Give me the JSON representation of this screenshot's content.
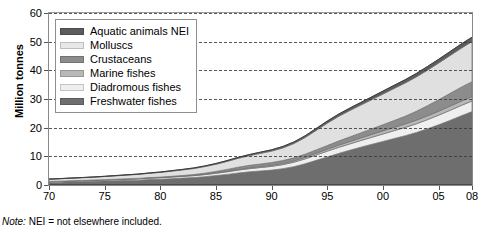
{
  "chart_data": {
    "type": "area",
    "stacked": true,
    "title": "",
    "xlabel": "",
    "ylabel": "Million tonnes",
    "ylim": [
      0,
      60
    ],
    "xlim": [
      1970,
      2008
    ],
    "grid": true,
    "gridstyle": "dashed-horizontal",
    "legend_position": "top-left",
    "ytick_labels": [
      "0",
      "10",
      "20",
      "30",
      "40",
      "50",
      "60"
    ],
    "ytick_values": [
      0,
      10,
      20,
      30,
      40,
      50,
      60
    ],
    "xtick_labels": [
      "70",
      "75",
      "80",
      "85",
      "90",
      "95",
      "00",
      "05",
      "08"
    ],
    "xtick_values": [
      1970,
      1975,
      1980,
      1985,
      1990,
      1995,
      2000,
      2005,
      2008
    ],
    "x": [
      1970,
      1971,
      1972,
      1973,
      1974,
      1975,
      1976,
      1977,
      1978,
      1979,
      1980,
      1981,
      1982,
      1983,
      1984,
      1985,
      1986,
      1987,
      1988,
      1989,
      1990,
      1991,
      1992,
      1993,
      1994,
      1995,
      1996,
      1997,
      1998,
      1999,
      2000,
      2001,
      2002,
      2003,
      2004,
      2005,
      2006,
      2007,
      2008
    ],
    "series": [
      {
        "name": "Freshwater fishes",
        "color": "#6e6e6e",
        "values": [
          0.9,
          1.0,
          1.1,
          1.2,
          1.3,
          1.4,
          1.5,
          1.6,
          1.7,
          1.9,
          2.0,
          2.2,
          2.4,
          2.6,
          2.9,
          3.3,
          3.7,
          4.2,
          4.6,
          4.9,
          5.2,
          5.7,
          6.4,
          7.4,
          8.6,
          9.8,
          11.0,
          12.1,
          13.2,
          14.2,
          15.2,
          16.2,
          17.2,
          18.3,
          19.6,
          21.0,
          22.5,
          24.1,
          25.6
        ]
      },
      {
        "name": "Diadromous fishes",
        "color": "#efefef",
        "values": [
          0.25,
          0.27,
          0.29,
          0.31,
          0.33,
          0.35,
          0.38,
          0.41,
          0.44,
          0.48,
          0.52,
          0.56,
          0.6,
          0.65,
          0.72,
          0.8,
          0.9,
          1.0,
          1.1,
          1.2,
          1.3,
          1.4,
          1.55,
          1.7,
          1.85,
          2.0,
          2.1,
          2.2,
          2.3,
          2.45,
          2.6,
          2.75,
          2.9,
          3.05,
          3.2,
          3.35,
          3.5,
          3.6,
          3.7
        ]
      },
      {
        "name": "Marine fishes",
        "color": "#b8b8b8",
        "values": [
          0.05,
          0.05,
          0.06,
          0.06,
          0.07,
          0.07,
          0.08,
          0.09,
          0.1,
          0.11,
          0.12,
          0.13,
          0.14,
          0.16,
          0.18,
          0.2,
          0.23,
          0.26,
          0.3,
          0.34,
          0.38,
          0.42,
          0.47,
          0.53,
          0.6,
          0.68,
          0.76,
          0.84,
          0.92,
          1.0,
          1.08,
          1.14,
          1.2,
          1.26,
          1.32,
          1.38,
          1.44,
          1.5,
          1.56
        ]
      },
      {
        "name": "Crustaceans",
        "color": "#8c8c8c",
        "values": [
          0.02,
          0.02,
          0.03,
          0.03,
          0.04,
          0.04,
          0.05,
          0.06,
          0.07,
          0.09,
          0.11,
          0.14,
          0.18,
          0.24,
          0.33,
          0.45,
          0.6,
          0.75,
          0.85,
          0.9,
          0.95,
          1.0,
          1.05,
          1.1,
          1.2,
          1.3,
          1.45,
          1.6,
          1.75,
          1.95,
          2.15,
          2.4,
          2.7,
          3.1,
          3.55,
          4.0,
          4.45,
          4.85,
          5.2
        ]
      },
      {
        "name": "Molluscs",
        "color": "#e0e0e0",
        "values": [
          0.8,
          0.85,
          0.9,
          0.95,
          1.0,
          1.1,
          1.2,
          1.3,
          1.4,
          1.5,
          1.65,
          1.8,
          1.95,
          2.1,
          2.3,
          2.5,
          2.8,
          3.1,
          3.4,
          3.7,
          4.0,
          4.4,
          5.0,
          5.8,
          6.8,
          7.8,
          8.6,
          9.2,
          9.7,
          10.2,
          10.7,
          11.2,
          11.6,
          12.0,
          12.4,
          12.8,
          13.2,
          13.6,
          14.0
        ]
      },
      {
        "name": "Aquatic animals NEI",
        "color": "#5c5c5c",
        "values": [
          0.05,
          0.05,
          0.06,
          0.06,
          0.07,
          0.08,
          0.09,
          0.1,
          0.11,
          0.12,
          0.14,
          0.16,
          0.18,
          0.2,
          0.23,
          0.26,
          0.3,
          0.34,
          0.38,
          0.42,
          0.46,
          0.5,
          0.55,
          0.6,
          0.66,
          0.72,
          0.78,
          0.84,
          0.9,
          0.96,
          1.02,
          1.08,
          1.14,
          1.2,
          1.26,
          1.32,
          1.38,
          1.44,
          1.5
        ]
      }
    ],
    "totals_endpoints": {
      "1970": 2.1,
      "2008": 52.5
    },
    "legend_order_top_to_bottom": [
      "Aquatic animals NEI",
      "Molluscs",
      "Crustaceans",
      "Marine fishes",
      "Diadromous fishes",
      "Freshwater fishes"
    ]
  },
  "axis": {
    "y_title": "Million tonnes"
  },
  "legend": {
    "items": [
      {
        "label": "Aquatic animals NEI",
        "color": "#5c5c5c"
      },
      {
        "label": "Molluscs",
        "color": "#e8e8e8"
      },
      {
        "label": "Crustaceans",
        "color": "#8c8c8c"
      },
      {
        "label": "Marine fishes",
        "color": "#b8b8b8"
      },
      {
        "label": "Diadromous fishes",
        "color": "#efefef"
      },
      {
        "label": "Freshwater fishes",
        "color": "#6e6e6e"
      }
    ]
  },
  "footnote": {
    "prefix": "Note:",
    "text": " NEI = not elsewhere included."
  }
}
